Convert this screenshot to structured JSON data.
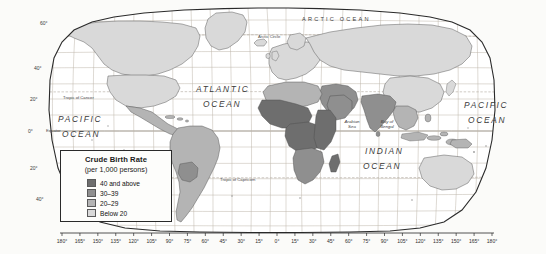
{
  "map": {
    "title": "Crude Birth Rate (per 1,000 persons) World Map",
    "projection": "robinson",
    "background_color": "#fbfbf9",
    "ocean_color": "#ffffff",
    "graticule_color": "#b9b0a4",
    "coastline_color": "#555555",
    "frame_color": "#2a2a2a"
  },
  "legend": {
    "title": "Crude Birth Rate",
    "subtitle": "(per 1,000 persons)",
    "entries": [
      {
        "label": "40 and above",
        "color": "#6e6e6e"
      },
      {
        "label": "30–39",
        "color": "#8f8f8f"
      },
      {
        "label": "20–29",
        "color": "#b4b4b4"
      },
      {
        "label": "Below 20",
        "color": "#d9d9d9"
      }
    ]
  },
  "ocean_labels": [
    {
      "name": "arctic-ocean",
      "text": "ARCTIC  OCEAN",
      "x": 302,
      "y": 16,
      "style": "ocean-arctic"
    },
    {
      "name": "atlantic-ocean-line1",
      "text": "ATLANTIC",
      "x": 196,
      "y": 84,
      "style": "ocean-major"
    },
    {
      "name": "atlantic-ocean-line2",
      "text": "OCEAN",
      "x": 203,
      "y": 99,
      "style": "ocean-major"
    },
    {
      "name": "pacific-ocean-west-line1",
      "text": "PACIFIC",
      "x": 58,
      "y": 114,
      "style": "ocean-major"
    },
    {
      "name": "pacific-ocean-west-line2",
      "text": "OCEAN",
      "x": 62,
      "y": 129,
      "style": "ocean-major"
    },
    {
      "name": "pacific-ocean-east-line1",
      "text": "PACIFIC",
      "x": 464,
      "y": 100,
      "style": "ocean-major"
    },
    {
      "name": "pacific-ocean-east-line2",
      "text": "OCEAN",
      "x": 468,
      "y": 115,
      "style": "ocean-major"
    },
    {
      "name": "indian-ocean-line1",
      "text": "INDIAN",
      "x": 365,
      "y": 146,
      "style": "ocean-major"
    },
    {
      "name": "indian-ocean-line2",
      "text": "OCEAN",
      "x": 363,
      "y": 161,
      "style": "ocean-major"
    }
  ],
  "sea_labels": [
    {
      "name": "arabian-sea",
      "text": "Arabian\nSea",
      "x": 352,
      "y": 119
    },
    {
      "name": "bay-of-bengal",
      "text": "Bay of\nBengal",
      "x": 387,
      "y": 119
    }
  ],
  "reference_lines": [
    {
      "name": "arctic-circle",
      "text": "Arctic Circle",
      "x": 258,
      "y": 34,
      "y_line": 37
    },
    {
      "name": "tropic-of-cancer",
      "text": "Tropic of Cancer",
      "x": 63,
      "y": 95,
      "y_line": 99
    },
    {
      "name": "equator",
      "text": "Equator",
      "x": 46,
      "y": 128,
      "y_line": 131
    },
    {
      "name": "tropic-of-capricorn",
      "text": "Tropic of Capricorn",
      "x": 220,
      "y": 177,
      "y_line": 181
    }
  ],
  "latitude_labels": [
    {
      "text": "60°",
      "x": 40,
      "y": 23
    },
    {
      "text": "40°",
      "x": 34,
      "y": 68
    },
    {
      "text": "20°",
      "x": 30,
      "y": 99
    },
    {
      "text": "0°",
      "x": 28,
      "y": 131
    },
    {
      "text": "20°",
      "x": 30,
      "y": 168
    },
    {
      "text": "40°",
      "x": 36,
      "y": 199
    }
  ],
  "longitude_labels": [
    "180°",
    "165°",
    "150°",
    "135°",
    "120°",
    "105°",
    "90°",
    "75°",
    "60°",
    "45°",
    "30°",
    "15°",
    "0°",
    "15°",
    "30°",
    "45°",
    "60°",
    "75°",
    "90°",
    "105°",
    "120°",
    "135°",
    "150°",
    "165°",
    "180°"
  ],
  "chart_data": {
    "type": "choropleth",
    "title": "Crude Birth Rate",
    "unit": "per 1,000 persons",
    "classes": [
      {
        "label": "40 and above",
        "min": 40,
        "max": null,
        "color": "#6e6e6e"
      },
      {
        "label": "30–39",
        "min": 30,
        "max": 39,
        "color": "#8f8f8f"
      },
      {
        "label": "20–29",
        "min": 20,
        "max": 29,
        "color": "#b4b4b4"
      },
      {
        "label": "Below 20",
        "min": null,
        "max": 19,
        "color": "#d9d9d9"
      }
    ],
    "regions": [
      {
        "region": "Sub-Saharan Africa",
        "class": "40 and above"
      },
      {
        "region": "Sahel / West Africa",
        "class": "40 and above"
      },
      {
        "region": "Central Africa",
        "class": "40 and above"
      },
      {
        "region": "East Africa",
        "class": "40 and above"
      },
      {
        "region": "Southern Africa",
        "class": "30–39"
      },
      {
        "region": "North Africa",
        "class": "20–29"
      },
      {
        "region": "Arabian Peninsula",
        "class": "30–39"
      },
      {
        "region": "Middle East",
        "class": "30–39"
      },
      {
        "region": "South Asia",
        "class": "30–39"
      },
      {
        "region": "Southeast Asia",
        "class": "20–29"
      },
      {
        "region": "Central America",
        "class": "20–29"
      },
      {
        "region": "Bolivia",
        "class": "30–39"
      },
      {
        "region": "Brazil",
        "class": "20–29"
      },
      {
        "region": "Argentina / Chile",
        "class": "Below 20"
      },
      {
        "region": "United States",
        "class": "Below 20"
      },
      {
        "region": "Canada",
        "class": "Below 20"
      },
      {
        "region": "Europe",
        "class": "Below 20"
      },
      {
        "region": "Russia",
        "class": "Below 20"
      },
      {
        "region": "China",
        "class": "Below 20"
      },
      {
        "region": "Australia",
        "class": "Below 20"
      },
      {
        "region": "Japan",
        "class": "Below 20"
      }
    ]
  }
}
